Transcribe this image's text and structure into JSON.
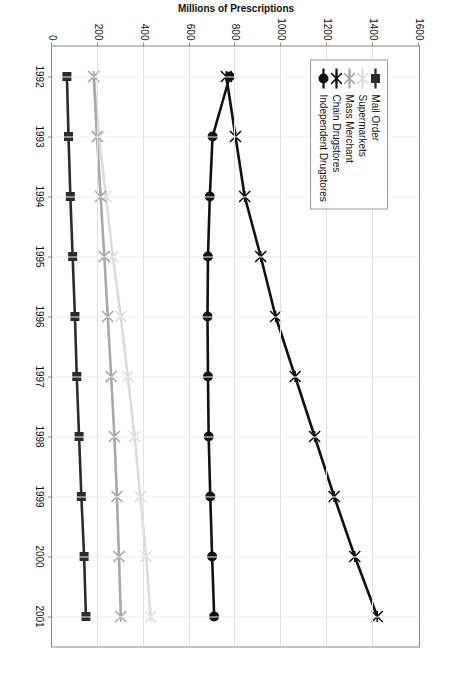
{
  "chart_data": {
    "type": "line",
    "title": "",
    "xlabel": "",
    "ylabel": "Millions of Prescriptions",
    "x": [
      1992,
      1993,
      1994,
      1995,
      1996,
      1997,
      1998,
      1999,
      2000,
      2001
    ],
    "xtick_labels": [
      "1992",
      "1993",
      "1994",
      "1995",
      "1996",
      "1997",
      "1998",
      "1999",
      "2000",
      "2001"
    ],
    "ytick_labels": [
      "0",
      "200",
      "400",
      "600",
      "800",
      "1000",
      "1200",
      "1400",
      "1600"
    ],
    "yticks": [
      0,
      200,
      400,
      600,
      800,
      1000,
      1200,
      1400,
      1600
    ],
    "ylim": [
      0,
      1600
    ],
    "grid": true,
    "legend_position": "upper-left",
    "series": [
      {
        "name": "Mail Order",
        "marker": "square",
        "color": "#2b2b2b",
        "values": [
          65,
          72,
          80,
          90,
          100,
          108,
          118,
          128,
          140,
          148
        ]
      },
      {
        "name": "Supermarkets",
        "marker": "x",
        "color": "#dcdcdc",
        "values": [
          182,
          205,
          235,
          265,
          300,
          330,
          360,
          385,
          410,
          430
        ]
      },
      {
        "name": "Mass Merchant",
        "marker": "x",
        "color": "#a8a8a8",
        "values": [
          182,
          196,
          212,
          228,
          243,
          258,
          272,
          283,
          292,
          300
        ]
      },
      {
        "name": "Chain Drugstores",
        "marker": "x",
        "color": "#111111",
        "values": [
          760,
          800,
          840,
          910,
          975,
          1060,
          1145,
          1230,
          1320,
          1418
        ]
      },
      {
        "name": "Independent Drugstores",
        "marker": "circle",
        "color": "#111111",
        "values": [
          775,
          700,
          688,
          680,
          678,
          680,
          683,
          690,
          698,
          707
        ]
      }
    ]
  },
  "legend": {
    "entries": [
      {
        "label": "Mail Order"
      },
      {
        "label": "Supermarkets"
      },
      {
        "label": "Mass Merchant"
      },
      {
        "label": "Chain Drugstores"
      },
      {
        "label": "Independent Drugstores"
      }
    ]
  }
}
